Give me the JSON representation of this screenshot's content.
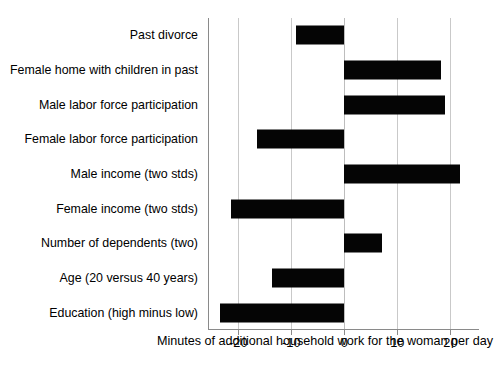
{
  "chart_data": {
    "type": "bar",
    "orientation": "horizontal",
    "title": "",
    "subtitle": "",
    "xlabel": "Minutes of additional household work for the woman per day",
    "ylabel": "",
    "categories": [
      "Past divorce",
      "Female home with children in past",
      "Male labor force participation",
      "Female labor force participation",
      "Male income (two stds)",
      "Female income (two stds)",
      "Number of dependents (two)",
      "Age (20 versus 40 years)",
      "Education (high minus low)"
    ],
    "values": [
      -9.2,
      18.2,
      19.0,
      -16.5,
      21.9,
      -21.3,
      7.2,
      -13.6,
      -23.4
    ],
    "xticks": [
      -20,
      -10,
      0,
      10,
      20
    ],
    "xtick_labels": [
      "-20",
      "-10",
      "0",
      "10",
      "20"
    ],
    "xlim": [
      -25.8,
      25.3
    ],
    "grid": "vertical",
    "legend": "none",
    "bar_color": "#050505",
    "grid_color": "#c9c9c9",
    "axis_color": "#8a8a8a"
  }
}
